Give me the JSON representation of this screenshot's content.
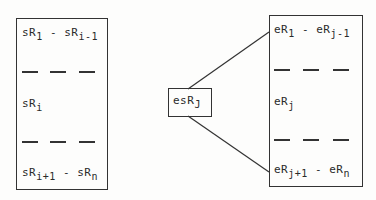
{
  "left_block": {
    "rows": [
      {
        "a_base": "sR",
        "a_sub": "1",
        "sep": " - ",
        "b_base": "sR",
        "b_sub": "i-1"
      },
      {
        "a_base": "sR",
        "a_sub": "i"
      },
      {
        "a_base": "sR",
        "a_sub": "i+1",
        "sep": " - ",
        "b_base": "sR",
        "b_sub": "n"
      }
    ]
  },
  "center_node": {
    "base": "esR",
    "sub": "J"
  },
  "right_block": {
    "rows": [
      {
        "a_base": "eR",
        "a_sub": "1",
        "sep": " - ",
        "b_base": "eR",
        "b_sub": "j-1"
      },
      {
        "a_base": "eR",
        "a_sub": "j"
      },
      {
        "a_base": "eR",
        "a_sub": "j+1",
        "sep": " - ",
        "b_base": "eR",
        "b_sub": "n"
      }
    ]
  }
}
